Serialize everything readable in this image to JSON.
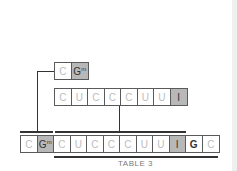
{
  "diagram": {
    "top_row": [
      {
        "label": "C",
        "sup": "",
        "style": "normal"
      },
      {
        "label": "G",
        "sup": "m",
        "style": "shade"
      }
    ],
    "middle_row": [
      {
        "label": "C",
        "sup": "",
        "style": "normal"
      },
      {
        "label": "U",
        "sup": "",
        "style": "normal"
      },
      {
        "label": "C",
        "sup": "",
        "style": "normal"
      },
      {
        "label": "C",
        "sup": "",
        "style": "normal"
      },
      {
        "label": "C",
        "sup": "",
        "style": "normal"
      },
      {
        "label": "U",
        "sup": "",
        "style": "normal"
      },
      {
        "label": "U",
        "sup": "",
        "style": "normal"
      },
      {
        "label": "I",
        "sup": "",
        "style": "shade"
      }
    ],
    "bottom_row": [
      {
        "label": "C",
        "sup": "",
        "style": "normal"
      },
      {
        "label": "G",
        "sup": "m",
        "style": "shade"
      },
      {
        "label": "C",
        "sup": "",
        "style": "normal"
      },
      {
        "label": "U",
        "sup": "",
        "style": "normal"
      },
      {
        "label": "C",
        "sup": "",
        "style": "normal"
      },
      {
        "label": "C",
        "sup": "",
        "style": "normal"
      },
      {
        "label": "C",
        "sup": "",
        "style": "normal"
      },
      {
        "label": "U",
        "sup": "",
        "style": "normal"
      },
      {
        "label": "U",
        "sup": "",
        "style": "normal"
      },
      {
        "label": "I",
        "sup": "",
        "style": "shade"
      },
      {
        "label": "G",
        "sup": "",
        "style": "dark"
      },
      {
        "label": "C",
        "sup": "",
        "style": "normal"
      }
    ],
    "caption": "TABLE 3"
  }
}
